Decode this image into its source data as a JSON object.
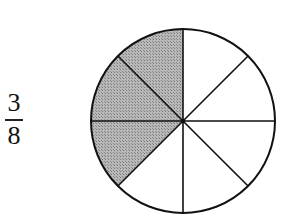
{
  "fraction": {
    "numerator": "3",
    "denominator": "8"
  },
  "pie": {
    "slices": 8,
    "shaded_slices": 3,
    "shaded_color": "#a9a9a9",
    "stroke_color": "#111111",
    "center": [
      183,
      121
    ],
    "radius": 92
  }
}
